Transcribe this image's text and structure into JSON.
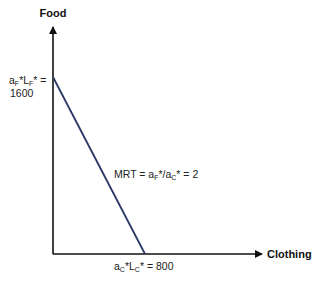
{
  "chart_data": {
    "type": "line",
    "title": "",
    "xlabel": "Clothing",
    "ylabel": "Food",
    "xlim": [
      0,
      1150
    ],
    "ylim": [
      0,
      2000
    ],
    "grid": false,
    "series": [
      {
        "name": "Production possibility frontier",
        "color": "#2b3765",
        "points": [
          [
            0,
            1600
          ],
          [
            800,
            0
          ]
        ]
      }
    ],
    "annotations": {
      "y_intercept": {
        "base": "a",
        "sub1": "F",
        "mid": "*L",
        "sub2": "F",
        "tail": "* =",
        "value": "1600"
      },
      "x_intercept": {
        "base": "a",
        "sub1": "C",
        "mid": "*L",
        "sub2": "C",
        "tail": "* = 800"
      },
      "slope": {
        "prefix": "MRT = a",
        "sub1": "F",
        "mid": "*/a",
        "sub2": "C",
        "tail": "* = 2"
      }
    }
  }
}
